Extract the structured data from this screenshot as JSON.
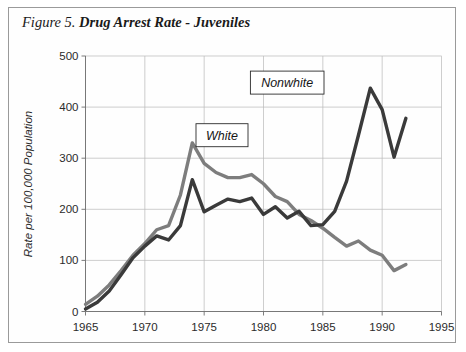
{
  "figure": {
    "number": "Figure 5.",
    "name": "Drug Arrest Rate - Juveniles"
  },
  "chart_data": {
    "type": "line",
    "title": "Drug Arrest Rate - Juveniles",
    "xlabel": "",
    "ylabel": "Rate per 100,000 Population",
    "xlim": [
      1965,
      1995
    ],
    "ylim": [
      0,
      500
    ],
    "xticks": [
      "1965",
      "1970",
      "1975",
      "1980",
      "1985",
      "1990",
      "1995"
    ],
    "yticks": [
      "0",
      "100",
      "200",
      "300",
      "400",
      "500"
    ],
    "grid": true,
    "legend": "inline-labels",
    "x": [
      1965,
      1966,
      1967,
      1968,
      1969,
      1970,
      1971,
      1972,
      1973,
      1974,
      1975,
      1976,
      1977,
      1978,
      1979,
      1980,
      1981,
      1982,
      1983,
      1984,
      1985,
      1986,
      1987,
      1988,
      1989,
      1990,
      1991,
      1992
    ],
    "series": [
      {
        "name": "White",
        "color": "#7d7d7d",
        "values": [
          14,
          30,
          52,
          80,
          110,
          133,
          160,
          168,
          228,
          330,
          290,
          272,
          262,
          262,
          268,
          250,
          225,
          215,
          190,
          178,
          163,
          145,
          128,
          138,
          120,
          110,
          80,
          92
        ]
      },
      {
        "name": "Nonwhite",
        "color": "#3a3a3a",
        "values": [
          5,
          18,
          40,
          72,
          105,
          128,
          148,
          140,
          168,
          258,
          195,
          208,
          220,
          215,
          222,
          190,
          205,
          183,
          196,
          168,
          170,
          196,
          255,
          345,
          437,
          395,
          302,
          378
        ]
      }
    ],
    "annotations": [
      {
        "label": "White",
        "x": 1976.5,
        "y": 345
      },
      {
        "label": "Nonwhite",
        "x": 1982.0,
        "y": 448
      }
    ]
  }
}
